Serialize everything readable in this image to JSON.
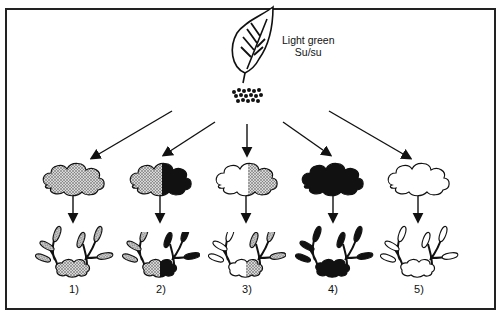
{
  "parent": {
    "label_line1": "Light green",
    "label_line2": "Su/su"
  },
  "offspring": [
    {
      "label": "1)",
      "fill": "dotted"
    },
    {
      "label": "2)",
      "fill": "half-dotted-half-black"
    },
    {
      "label": "3)",
      "fill": "half-white-half-dotted"
    },
    {
      "label": "4)",
      "fill": "black"
    },
    {
      "label": "5)",
      "fill": "white"
    }
  ],
  "colors": {
    "line": "#111111",
    "stipple": "#9a9a9a",
    "background": "#ffffff"
  }
}
